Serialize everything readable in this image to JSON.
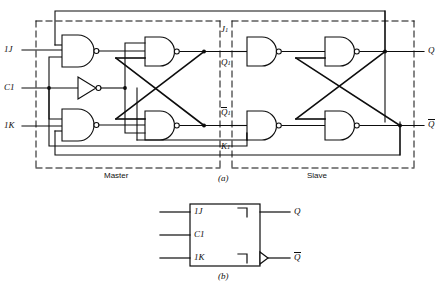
{
  "figure": {
    "parts": [
      {
        "id": "a",
        "caption": "(a)",
        "kind": "gate-level-schematic"
      },
      {
        "id": "b",
        "caption": "(b)",
        "kind": "logic-symbol"
      }
    ]
  },
  "schematic": {
    "blocks": [
      {
        "name": "master",
        "label": "Master"
      },
      {
        "name": "slave",
        "label": "Slave"
      }
    ],
    "inputs": [
      {
        "name": "j-input",
        "label": "1J",
        "base": "1J",
        "bar": false
      },
      {
        "name": "clock-input",
        "label": "C1",
        "base": "C1",
        "bar": false
      },
      {
        "name": "k-input",
        "label": "1K",
        "base": "1K",
        "bar": false
      }
    ],
    "internal_nodes": [
      {
        "name": "j1-node",
        "base": "J",
        "sub": "1",
        "bar": false,
        "label": "J1"
      },
      {
        "name": "q1-node",
        "base": "Q",
        "sub": "1",
        "bar": false,
        "label": "Q1"
      },
      {
        "name": "q1-bar-node",
        "base": "Q",
        "sub": "1",
        "bar": true,
        "label": "Q1-bar"
      },
      {
        "name": "k1-node",
        "base": "K",
        "sub": "1",
        "bar": false,
        "label": "K1"
      }
    ],
    "outputs": [
      {
        "name": "q-output",
        "base": "Q",
        "bar": false,
        "label": "Q"
      },
      {
        "name": "q-bar-output",
        "base": "Q",
        "bar": true,
        "label": "Q-bar"
      }
    ],
    "gates": [
      {
        "name": "master-input-nand-j",
        "type": "nand",
        "inputs": 3
      },
      {
        "name": "clock-inverter",
        "type": "inverter",
        "inputs": 1
      },
      {
        "name": "master-input-nand-k",
        "type": "nand",
        "inputs": 3
      },
      {
        "name": "master-latch-nand-q",
        "type": "nand",
        "inputs": 2
      },
      {
        "name": "master-latch-nand-qbar",
        "type": "nand",
        "inputs": 2
      },
      {
        "name": "slave-input-nand-j",
        "type": "nand",
        "inputs": 2
      },
      {
        "name": "slave-input-nand-k",
        "type": "nand",
        "inputs": 2
      },
      {
        "name": "slave-latch-nand-q",
        "type": "nand",
        "inputs": 2
      },
      {
        "name": "slave-latch-nand-qbar",
        "type": "nand",
        "inputs": 2
      }
    ],
    "caption": "(a)"
  },
  "symbol": {
    "inputs": [
      {
        "name": "symbol-j-input",
        "label": "1J"
      },
      {
        "name": "symbol-clock-input",
        "label": "C1"
      },
      {
        "name": "symbol-k-input",
        "label": "1K"
      }
    ],
    "outputs": [
      {
        "name": "symbol-q-output",
        "base": "Q",
        "bar": false,
        "label": "Q"
      },
      {
        "name": "symbol-q-bar-output",
        "base": "Q",
        "bar": true,
        "label": "Q-bar"
      }
    ],
    "annotations": [
      {
        "name": "postponed-output-indicator-top",
        "glyph": "postponed-output"
      },
      {
        "name": "postponed-output-indicator-bottom",
        "glyph": "postponed-output"
      },
      {
        "name": "negation-indicator",
        "glyph": "inversion-triangle"
      }
    ],
    "caption": "(b)"
  },
  "colors": {
    "line": "#0d0d0d",
    "dashed": "#1a1a1a",
    "background": "#ffffff",
    "text": "#0d0d0d"
  }
}
